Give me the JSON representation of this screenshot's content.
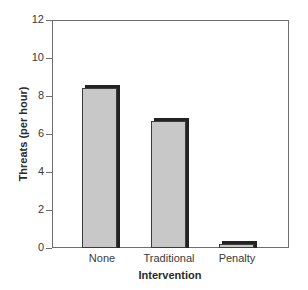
{
  "chart_data": {
    "type": "bar",
    "title": "",
    "xlabel": "Intervention",
    "ylabel": "Threats (per hour)",
    "categories": [
      "None",
      "Traditional",
      "Penalty"
    ],
    "values": [
      8.4,
      6.7,
      0.2
    ],
    "ylim": [
      0,
      12
    ],
    "yticks": [
      0,
      2,
      4,
      6,
      8,
      10,
      12
    ],
    "grid": false,
    "legend": null,
    "colors": {
      "bar_fill": "#c8c8c8",
      "bar_shadow": "#222222",
      "axis": "#6e6e6e"
    }
  },
  "axis": {
    "x_title": "Intervention",
    "y_title": "Threats (per hour)",
    "y_tick_labels": [
      "0",
      "2",
      "4",
      "6",
      "8",
      "10",
      "12"
    ],
    "x_tick_labels": [
      "None",
      "Traditional",
      "Penalty"
    ]
  }
}
